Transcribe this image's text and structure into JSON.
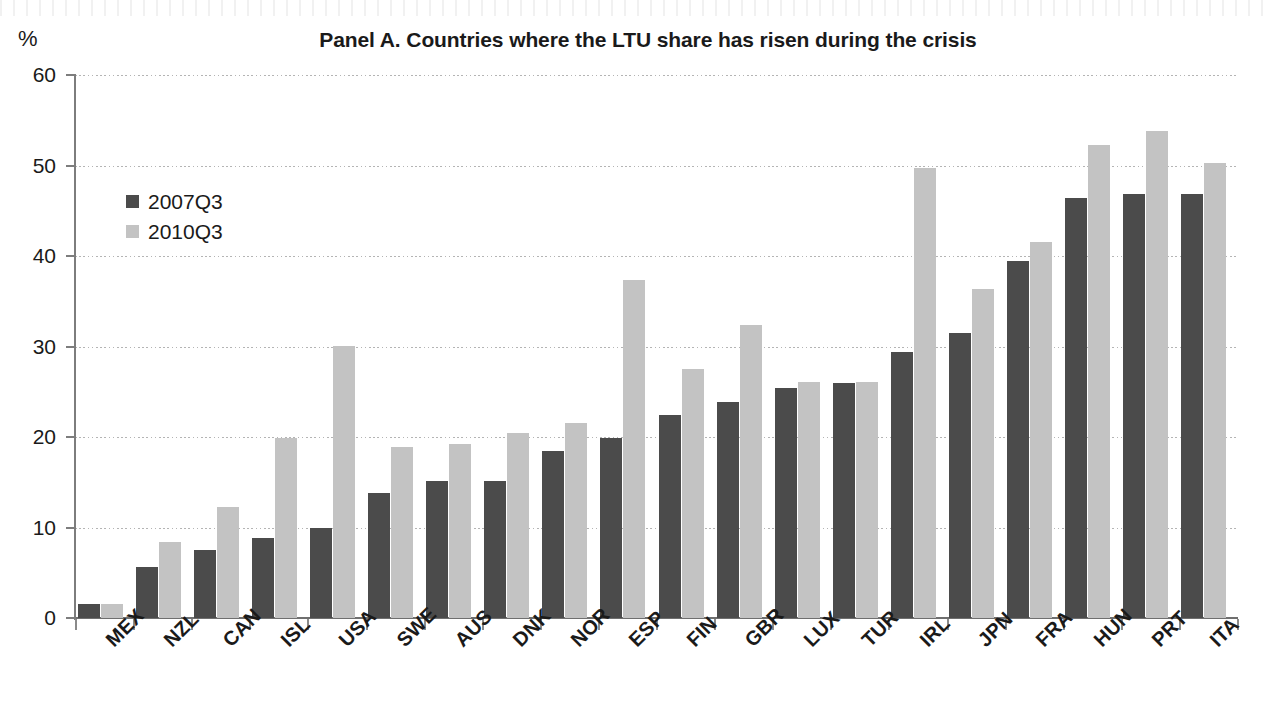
{
  "unit_label": "%",
  "legend": {
    "position": "inside-top-left",
    "items": [
      {
        "label": "2007Q3",
        "color": "#4b4b4b",
        "swatch_name": "legend-swatch-2007q3"
      },
      {
        "label": "2010Q3",
        "color": "#c3c3c3",
        "swatch_name": "legend-swatch-2010q3"
      }
    ]
  },
  "chart_data": {
    "type": "bar",
    "title": "Panel A. Countries where the LTU share has risen during the crisis",
    "xlabel": "",
    "ylabel": "%",
    "ylim": [
      0,
      60
    ],
    "yticks": [
      0,
      10,
      20,
      30,
      40,
      50,
      60
    ],
    "ytick_labels": [
      "0",
      "10",
      "20",
      "30",
      "40",
      "50",
      "60"
    ],
    "grid": true,
    "grid_axis": "y",
    "legend_position": "upper left (inside plot)",
    "categories": [
      "MEX",
      "NZL",
      "CAN",
      "ISL",
      "USA",
      "SWE",
      "AUS",
      "DNK",
      "NOR",
      "ESP",
      "FIN",
      "GBR",
      "LUX",
      "TUR",
      "IRL",
      "JPN",
      "FRA",
      "HUN",
      "PRT",
      "ITA"
    ],
    "series": [
      {
        "name": "2007Q3",
        "color": "#4b4b4b",
        "values": [
          1.5,
          5.6,
          7.5,
          8.8,
          9.9,
          13.8,
          15.1,
          15.1,
          18.4,
          19.9,
          22.4,
          23.9,
          25.4,
          26.0,
          29.4,
          31.5,
          39.5,
          46.4,
          46.9,
          46.9
        ]
      },
      {
        "name": "2010Q3",
        "color": "#c3c3c3",
        "values": [
          1.6,
          8.4,
          12.3,
          19.9,
          30.1,
          18.9,
          19.2,
          20.4,
          21.6,
          37.3,
          27.5,
          32.4,
          26.1,
          26.1,
          49.7,
          36.3,
          41.5,
          52.3,
          53.8,
          50.3
        ]
      }
    ]
  }
}
